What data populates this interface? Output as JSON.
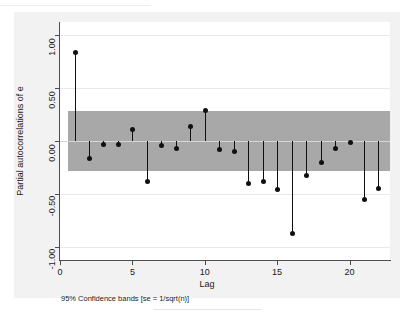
{
  "top_cropped_text": "——————————————————",
  "caption_cropped_text": "————————————",
  "figure": {
    "background_color": "#f2f2f2",
    "panel_color": "#ffffff",
    "band_color": "#a8a8a8",
    "marker_color": "#101010"
  },
  "footnote": "95% Confidence bands [se = 1/sqrt(n)]",
  "chart_data": {
    "type": "bar",
    "title": "",
    "subtitle": "",
    "xlabel": "Lag",
    "ylabel": "Partial autocorrelations of e",
    "xlim": [
      0,
      22.8
    ],
    "ylim": [
      -1.12,
      1.12
    ],
    "xticks": [
      0,
      5,
      10,
      15,
      20
    ],
    "xtick_labels": [
      "0",
      "5",
      "10",
      "15",
      "20"
    ],
    "yticks": [
      1.0,
      0.5,
      0.0,
      -0.5,
      -1.0
    ],
    "ytick_labels": [
      "1.00",
      "0.50",
      "0.00",
      "-0.50",
      "-1.00"
    ],
    "grid": true,
    "legend": "none",
    "confidence_band": {
      "label": "95% Confidence bands [se = 1/sqrt(n)]",
      "upper": 0.28,
      "lower": -0.28
    },
    "categories": [
      1,
      2,
      3,
      4,
      5,
      6,
      7,
      8,
      9,
      10,
      11,
      12,
      13,
      14,
      15,
      16,
      17,
      18,
      19,
      20,
      21,
      22
    ],
    "values": [
      0.83,
      -0.16,
      -0.03,
      -0.03,
      0.11,
      -0.38,
      -0.04,
      -0.07,
      0.14,
      0.29,
      -0.08,
      -0.1,
      -0.4,
      -0.38,
      -0.46,
      -0.87,
      -0.32,
      -0.2,
      -0.07,
      -0.01,
      -0.55,
      -0.45
    ],
    "series": [
      {
        "name": "Partial autocorrelations of e",
        "values": [
          0.83,
          -0.16,
          -0.03,
          -0.03,
          0.11,
          -0.38,
          -0.04,
          -0.07,
          0.14,
          0.29,
          -0.08,
          -0.1,
          -0.4,
          -0.38,
          -0.46,
          -0.87,
          -0.32,
          -0.2,
          -0.07,
          -0.01,
          -0.55,
          -0.45
        ]
      }
    ]
  }
}
